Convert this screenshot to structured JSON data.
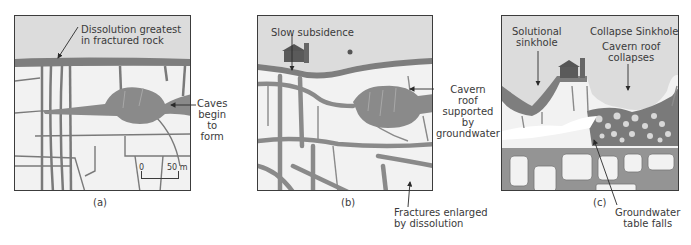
{
  "figure": {
    "colors": {
      "sky": "#dcdcdc",
      "rock": "#f2f2f2",
      "water": "#8a8a8a",
      "fracture": "#7a7a7a",
      "border": "#3c3c3c"
    },
    "panels": [
      {
        "id": "a",
        "caption": "(a)",
        "labels": {
          "dissolution_line1": "Dissolution greatest",
          "dissolution_line2": "in fractured rock",
          "caves_line1": "Caves",
          "caves_line2": "begin",
          "caves_line3": "to",
          "caves_line4": "form"
        },
        "scale_bar": {
          "start": "0",
          "end": "50 m"
        }
      },
      {
        "id": "b",
        "caption": "(b)",
        "labels": {
          "subsidence": "Slow subsidence",
          "cavern_line1": "Cavern",
          "cavern_line2": "roof",
          "cavern_line3": "supported",
          "cavern_line4": "by",
          "cavern_line5": "groundwater",
          "fractures_line1": "Fractures enlarged",
          "fractures_line2": "by dissolution"
        }
      },
      {
        "id": "c",
        "caption": "(c)",
        "labels": {
          "solutional_line1": "Solutional",
          "solutional_line2": "sinkhole",
          "collapse_title": "Collapse Sinkhole",
          "roof_line1": "Cavern roof",
          "roof_line2": "collapses",
          "gw_line1": "Groundwater",
          "gw_line2": "table falls"
        }
      }
    ]
  }
}
